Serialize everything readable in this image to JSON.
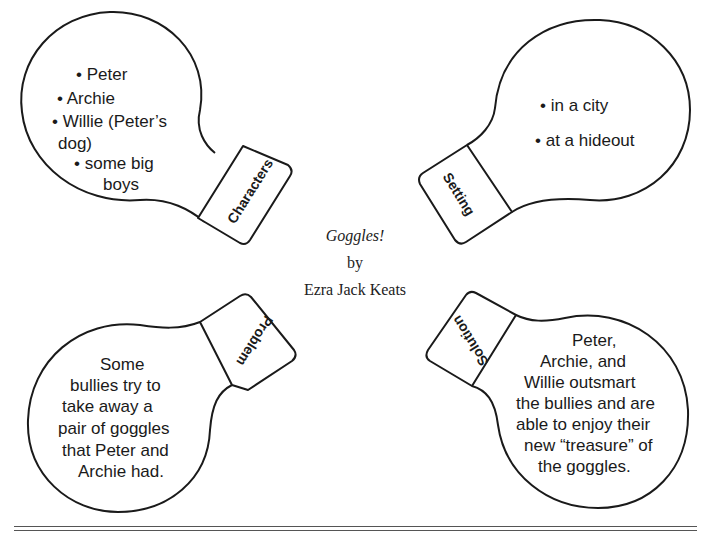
{
  "title_block": {
    "book_title": "Goggles!",
    "by": "by",
    "author": "Ezra Jack Keats"
  },
  "bulbs": {
    "characters": {
      "label": "Characters",
      "lines": [
        "• Peter",
        "• Archie",
        "• Willie (Peter’s",
        "dog)",
        "• some big",
        "boys"
      ]
    },
    "setting": {
      "label": "Setting",
      "lines": [
        "• in a city",
        "• at a hideout"
      ]
    },
    "problem": {
      "label": "Problem",
      "lines": [
        "Some",
        "bullies try to",
        "take away a",
        "pair of goggles",
        "that Peter and",
        "Archie had."
      ]
    },
    "solution": {
      "label": "Solution",
      "lines": [
        "Peter,",
        "Archie, and",
        "Willie outsmart",
        "the bullies and are",
        "able to enjoy their",
        "new “treasure” of",
        "the goggles."
      ]
    }
  },
  "colors": {
    "stroke": "#1a1a1a",
    "background": "#ffffff"
  }
}
